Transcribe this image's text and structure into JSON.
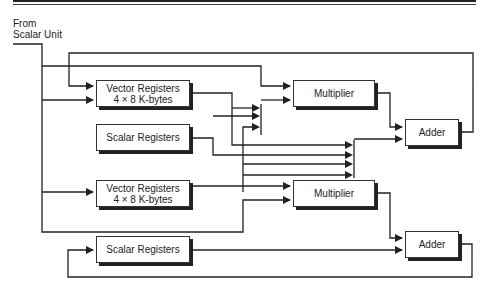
{
  "source": {
    "line1": "From",
    "line2": "Scalar Unit"
  },
  "blocks": {
    "vector_registers_1": {
      "line1": "Vector Registers",
      "line2": "4 × 8 K-bytes"
    },
    "scalar_registers_1": {
      "label": "Scalar Registers"
    },
    "multiplier_1": {
      "label": "Multiplier"
    },
    "adder_1": {
      "label": "Adder"
    },
    "vector_registers_2": {
      "line1": "Vector Registers",
      "line2": "4 × 8 K-bytes"
    },
    "multiplier_2": {
      "label": "Multiplier"
    },
    "scalar_registers_2": {
      "label": "Scalar Registers"
    },
    "adder_2": {
      "label": "Adder"
    }
  },
  "colors": {
    "line": "#222222",
    "box_border": "#333333",
    "shadow": "#222222",
    "background": "#ffffff"
  }
}
